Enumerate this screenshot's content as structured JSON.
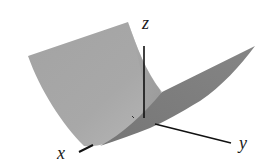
{
  "figure": {
    "type": "3d-surface-plot",
    "surface": "parabolic cylinder",
    "axes": {
      "x_label": "x",
      "y_label": "y",
      "z_label": "z"
    },
    "colors": {
      "background": "#ffffff",
      "left_sheet": "#a6a6a6",
      "left_sheet_shadow": "#b4b4b4",
      "right_sheet": "#7e7e7e",
      "inner_wall": "#9a9a9a",
      "axis": "#111111",
      "label": "#1a1a1a"
    }
  }
}
